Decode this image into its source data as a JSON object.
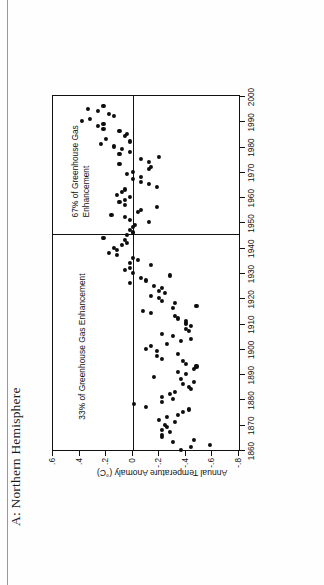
{
  "figure": {
    "title": "A: Northern Hemisphere"
  },
  "chart_data": {
    "type": "scatter",
    "title": "A: Northern Hemisphere",
    "xlabel": "",
    "ylabel": "Annual Temperature Anomaly (°C)",
    "xlim": [
      1860,
      2000
    ],
    "ylim": [
      -0.8,
      0.6
    ],
    "xticks": [
      1860,
      1870,
      1880,
      1890,
      1900,
      1910,
      1920,
      1930,
      1940,
      1950,
      1960,
      1970,
      1980,
      1990,
      2000
    ],
    "xticklabels": [
      "1860",
      "1870",
      "1880",
      "1890",
      "1900",
      "1910",
      "1920",
      "1930",
      "1940",
      "1950",
      "1960",
      "1970",
      "1980",
      "1990",
      "2000"
    ],
    "yticks": [
      0.6,
      0.4,
      0.2,
      0.0,
      -0.2,
      -0.4,
      -0.6,
      -0.8
    ],
    "yticklabels": [
      ".6",
      ".4",
      ".2",
      "0",
      "-.2",
      "-.4",
      "-.6",
      "-.8"
    ],
    "grid": false,
    "legend": "none",
    "zero_reference_line": 0.0,
    "panel_divider_x": 1945,
    "annotations": [
      {
        "text": "33% of Greenhouse Gas Enhancement",
        "x": 1872,
        "y": 0.42
      },
      {
        "text": "67% of Greenhouse Gas\nEnhancement",
        "x": 1952,
        "y": 0.47
      }
    ],
    "series": [
      {
        "name": "Annual Temperature Anomaly",
        "marker": "filled-circle",
        "color": "#0c0c0c",
        "points": [
          [
            1860,
            -0.36
          ],
          [
            1861,
            -0.44
          ],
          [
            1862,
            -0.58
          ],
          [
            1863,
            -0.3
          ],
          [
            1864,
            -0.46
          ],
          [
            1865,
            -0.22
          ],
          [
            1866,
            -0.22
          ],
          [
            1867,
            -0.28
          ],
          [
            1868,
            -0.22
          ],
          [
            1869,
            -0.26
          ],
          [
            1870,
            -0.24
          ],
          [
            1871,
            -0.32
          ],
          [
            1872,
            -0.2
          ],
          [
            1873,
            -0.26
          ],
          [
            1874,
            -0.34
          ],
          [
            1875,
            -0.38
          ],
          [
            1876,
            -0.42
          ],
          [
            1877,
            -0.1
          ],
          [
            1878,
            -0.01
          ],
          [
            1879,
            -0.22
          ],
          [
            1880,
            -0.3
          ],
          [
            1881,
            -0.22
          ],
          [
            1882,
            -0.28
          ],
          [
            1883,
            -0.32
          ],
          [
            1884,
            -0.44
          ],
          [
            1885,
            -0.42
          ],
          [
            1886,
            -0.38
          ],
          [
            1887,
            -0.46
          ],
          [
            1888,
            -0.36
          ],
          [
            1889,
            -0.16
          ],
          [
            1890,
            -0.4
          ],
          [
            1891,
            -0.34
          ],
          [
            1892,
            -0.46
          ],
          [
            1893,
            -0.48
          ],
          [
            1894,
            -0.4
          ],
          [
            1895,
            -0.38
          ],
          [
            1896,
            -0.22
          ],
          [
            1897,
            -0.18
          ],
          [
            1898,
            -0.34
          ],
          [
            1899,
            -0.18
          ],
          [
            1900,
            -0.1
          ],
          [
            1901,
            -0.14
          ],
          [
            1902,
            -0.26
          ],
          [
            1903,
            -0.36
          ],
          [
            1904,
            -0.44
          ],
          [
            1905,
            -0.3
          ],
          [
            1906,
            -0.22
          ],
          [
            1907,
            -0.42
          ],
          [
            1908,
            -0.4
          ],
          [
            1909,
            -0.44
          ],
          [
            1910,
            -0.4
          ],
          [
            1911,
            -0.4
          ],
          [
            1912,
            -0.34
          ],
          [
            1913,
            -0.32
          ],
          [
            1914,
            -0.14
          ],
          [
            1915,
            -0.08
          ],
          [
            1916,
            -0.3
          ],
          [
            1917,
            -0.48
          ],
          [
            1918,
            -0.32
          ],
          [
            1919,
            -0.22
          ],
          [
            1920,
            -0.2
          ],
          [
            1921,
            -0.14
          ],
          [
            1922,
            -0.24
          ],
          [
            1923,
            -0.2
          ],
          [
            1924,
            -0.22
          ],
          [
            1925,
            -0.16
          ],
          [
            1926,
            0.02
          ],
          [
            1927,
            -0.1
          ],
          [
            1928,
            -0.06
          ],
          [
            1929,
            -0.28
          ],
          [
            1930,
            0.0
          ],
          [
            1931,
            0.06
          ],
          [
            1932,
            0.02
          ],
          [
            1933,
            -0.14
          ],
          [
            1934,
            0.02
          ],
          [
            1935,
            -0.04
          ],
          [
            1936,
            0.0
          ],
          [
            1937,
            0.12
          ],
          [
            1938,
            0.18
          ],
          [
            1939,
            0.12
          ],
          [
            1940,
            0.14
          ],
          [
            1941,
            0.08
          ],
          [
            1942,
            0.04
          ],
          [
            1943,
            0.06
          ],
          [
            1944,
            0.22
          ],
          [
            1945,
            0.04
          ],
          [
            1946,
            0.0
          ],
          [
            1947,
            0.02
          ],
          [
            1948,
            0.0
          ],
          [
            1949,
            -0.02
          ],
          [
            1950,
            -0.12
          ],
          [
            1951,
            0.02
          ],
          [
            1952,
            0.06
          ],
          [
            1953,
            0.16
          ],
          [
            1954,
            -0.04
          ],
          [
            1955,
            -0.06
          ],
          [
            1956,
            -0.18
          ],
          [
            1957,
            0.06
          ],
          [
            1958,
            0.1
          ],
          [
            1959,
            0.06
          ],
          [
            1960,
            0.02
          ],
          [
            1961,
            0.12
          ],
          [
            1962,
            0.08
          ],
          [
            1963,
            0.06
          ],
          [
            1964,
            -0.18
          ],
          [
            1965,
            -0.12
          ],
          [
            1966,
            -0.06
          ],
          [
            1967,
            0.0
          ],
          [
            1968,
            -0.06
          ],
          [
            1969,
            0.04
          ],
          [
            1970,
            0.0
          ],
          [
            1971,
            -0.12
          ],
          [
            1972,
            -0.14
          ],
          [
            1973,
            0.1
          ],
          [
            1974,
            -0.12
          ],
          [
            1975,
            -0.06
          ],
          [
            1976,
            -0.2
          ],
          [
            1977,
            0.1
          ],
          [
            1978,
            0.02
          ],
          [
            1979,
            0.08
          ],
          [
            1980,
            0.14
          ],
          [
            1981,
            0.24
          ],
          [
            1982,
            0.02
          ],
          [
            1983,
            0.2
          ],
          [
            1984,
            0.06
          ],
          [
            1985,
            0.04
          ],
          [
            1986,
            0.1
          ],
          [
            1987,
            0.22
          ],
          [
            1988,
            0.26
          ],
          [
            1989,
            0.22
          ],
          [
            1990,
            0.38
          ],
          [
            1991,
            0.32
          ],
          [
            1992,
            0.14
          ],
          [
            1993,
            0.18
          ],
          [
            1994,
            0.26
          ],
          [
            1995,
            0.34
          ],
          [
            1996,
            0.22
          ]
        ]
      }
    ]
  }
}
